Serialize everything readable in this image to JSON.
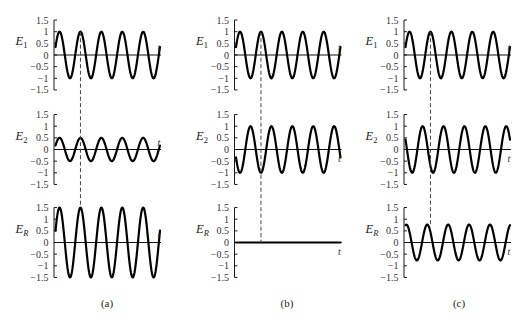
{
  "figure": {
    "colors": {
      "curve": "#000000",
      "axis": "#1a1a1a",
      "guide": "#444444",
      "background": "#ffffff"
    }
  },
  "chart_data": [
    {
      "id": "a",
      "type": "line",
      "caption": "(a)",
      "title": "",
      "xlabel": "t",
      "ylabel": "",
      "ylim": [
        -1.5,
        1.5
      ],
      "yticks": [
        1.5,
        1,
        0.5,
        0,
        -0.5,
        -1,
        -1.5
      ],
      "ytick_labels": [
        "1.5",
        "1",
        "0.5",
        "0",
        "−0.5",
        "−1",
        "−1.5"
      ],
      "grid": false,
      "periods": 5,
      "initial_phase_deg": 20,
      "series": [
        {
          "name": "E1",
          "symbol": "E",
          "subscript": "1",
          "amplitude": 1.0,
          "phase_deg": 0,
          "t_label_pos": "above"
        },
        {
          "name": "E2",
          "symbol": "E",
          "subscript": "2",
          "amplitude": 0.5,
          "phase_deg": 0,
          "t_label_pos": "above"
        },
        {
          "name": "ER",
          "symbol": "E",
          "subscript": "R",
          "amplitude": 1.5,
          "phase_deg": 0,
          "t_label_pos": "above"
        }
      ],
      "guide_line": {
        "style": "dashed",
        "at_peak_of": "E1",
        "peak_index": 2,
        "from_value": 1.0,
        "to_value": 1.5
      }
    },
    {
      "id": "b",
      "type": "line",
      "caption": "(b)",
      "title": "",
      "xlabel": "t",
      "ylabel": "",
      "ylim": [
        -1.5,
        1.5
      ],
      "yticks": [
        1.5,
        1,
        0.5,
        0,
        -0.5,
        -1,
        -1.5
      ],
      "ytick_labels": [
        "1.5",
        "1",
        "0.5",
        "0",
        "−0.5",
        "−1",
        "−1.5"
      ],
      "grid": false,
      "periods": 5,
      "initial_phase_deg": 20,
      "series": [
        {
          "name": "E1",
          "symbol": "E",
          "subscript": "1",
          "amplitude": 1.0,
          "phase_deg": 0,
          "t_label_pos": "above"
        },
        {
          "name": "E2",
          "symbol": "E",
          "subscript": "2",
          "amplitude": 1.0,
          "phase_deg": 180,
          "t_label_pos": "below"
        },
        {
          "name": "ER",
          "symbol": "E",
          "subscript": "R",
          "amplitude": 0.0,
          "phase_deg": 0,
          "t_label_pos": "below"
        }
      ],
      "guide_line": {
        "style": "dashed",
        "at_peak_of": "E1",
        "peak_index": 2,
        "from_value": 1.0,
        "to_value": 0
      }
    },
    {
      "id": "c",
      "type": "line",
      "caption": "(c)",
      "title": "",
      "xlabel": "t",
      "ylabel": "",
      "ylim": [
        -1.5,
        1.5
      ],
      "yticks": [
        1.5,
        1,
        0.5,
        0,
        -0.5,
        -1,
        -1.5
      ],
      "ytick_labels": [
        "1.5",
        "1",
        "0.5",
        "0",
        "−0.5",
        "−1",
        "−1.5"
      ],
      "grid": false,
      "periods": 5,
      "initial_phase_deg": 20,
      "series": [
        {
          "name": "E1",
          "symbol": "E",
          "subscript": "1",
          "amplitude": 1.0,
          "phase_deg": 0,
          "t_label_pos": "above"
        },
        {
          "name": "E2",
          "symbol": "E",
          "subscript": "2",
          "amplitude": 1.0,
          "phase_deg": 135,
          "t_label_pos": "below"
        },
        {
          "name": "ER",
          "symbol": "E",
          "subscript": "R",
          "amplitude": 0.77,
          "phase_deg": 55,
          "t_label_pos": "below"
        }
      ],
      "guide_line": {
        "style": "dashed",
        "at_peak_of": "E1",
        "peak_index": 2,
        "from_value": 1.0,
        "to_value": 0.75
      }
    }
  ]
}
